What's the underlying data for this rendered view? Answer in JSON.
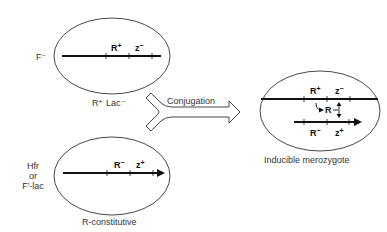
{
  "top_cell": {
    "strain_label": "F⁻",
    "caption": "R⁺ Lac⁻",
    "genes": [
      {
        "name": "R",
        "sign": "+"
      },
      {
        "name": "z",
        "sign": "−"
      }
    ]
  },
  "bottom_cell": {
    "strain_label_lines": [
      "Hfr",
      "or",
      "F′-lac"
    ],
    "caption": "R-constitutive",
    "genes": [
      {
        "name": "R",
        "sign": "−"
      },
      {
        "name": "z",
        "sign": "+"
      }
    ]
  },
  "arrow": {
    "label": "Conjugation"
  },
  "result_cell": {
    "caption": "Inducible merozygote",
    "upper_genes": [
      {
        "name": "R",
        "sign": "+"
      },
      {
        "name": "z",
        "sign": "−"
      }
    ],
    "repressor_label": "R",
    "lower_genes": [
      {
        "name": "R",
        "sign": "−"
      },
      {
        "name": "z",
        "sign": "+"
      }
    ]
  },
  "colors": {
    "line": "#1a1a1a",
    "outline": "#333333",
    "background": "#ffffff"
  }
}
